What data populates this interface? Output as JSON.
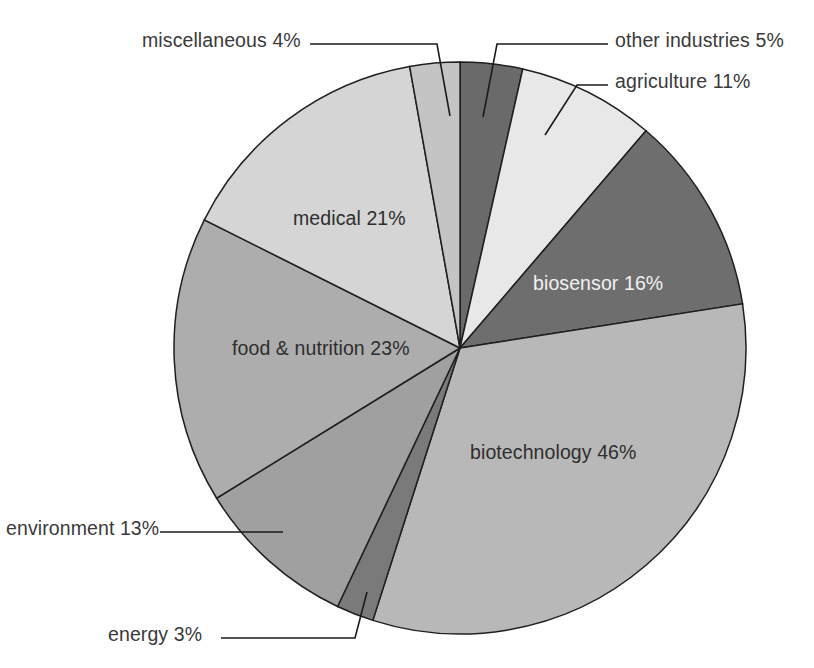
{
  "chart_data": {
    "type": "pie",
    "title": "",
    "subtitle": "",
    "xlabel": "",
    "ylabel": "",
    "legend_position": "none",
    "grid": false,
    "units": "percent",
    "note": "Slices are drawn proportionally; category shares sum to 142% because applications overlap.",
    "categories": [
      "other industries",
      "agriculture",
      "biosensor",
      "biotechnology",
      "energy",
      "environment",
      "food & nutrition",
      "medical",
      "miscellaneous"
    ],
    "values": [
      5,
      11,
      16,
      46,
      3,
      13,
      23,
      21,
      4
    ],
    "labels": [
      "other industries 5%",
      "agriculture 11%",
      "biosensor 16%",
      "biotechnology 46%",
      "energy 3%",
      "environment 13%",
      "food & nutrition 23%",
      "medical 21%",
      "miscellaneous 4%"
    ],
    "colors": [
      "#6a6a6a",
      "#e8e8e8",
      "#6e6e6e",
      "#b8b8b8",
      "#7a7a7a",
      "#a0a0a0",
      "#adadad",
      "#d5d5d5",
      "#c4c4c4"
    ],
    "slices": [
      {
        "name": "other industries",
        "value": 5,
        "label": "other industries 5%",
        "color": "#6a6a6a",
        "label_placement": "outside"
      },
      {
        "name": "agriculture",
        "value": 11,
        "label": "agriculture 11%",
        "color": "#e8e8e8",
        "label_placement": "outside"
      },
      {
        "name": "biosensor",
        "value": 16,
        "label": "biosensor 16%",
        "color": "#6e6e6e",
        "label_placement": "inside"
      },
      {
        "name": "biotechnology",
        "value": 46,
        "label": "biotechnology 46%",
        "color": "#b8b8b8",
        "label_placement": "inside"
      },
      {
        "name": "energy",
        "value": 3,
        "label": "energy 3%",
        "color": "#7a7a7a",
        "label_placement": "outside"
      },
      {
        "name": "environment",
        "value": 13,
        "label": "environment 13%",
        "color": "#a0a0a0",
        "label_placement": "outside"
      },
      {
        "name": "food & nutrition",
        "value": 23,
        "label": "food & nutrition 23%",
        "color": "#adadad",
        "label_placement": "inside"
      },
      {
        "name": "medical",
        "value": 21,
        "label": "medical 21%",
        "color": "#d5d5d5",
        "label_placement": "inside"
      },
      {
        "name": "miscellaneous",
        "value": 4,
        "label": "miscellaneous 4%",
        "color": "#c4c4c4",
        "label_placement": "outside"
      }
    ],
    "total": 142,
    "start_angle_deg": 0,
    "direction": "clockwise"
  },
  "labels": {
    "miscellaneous": "miscellaneous 4%",
    "other_industries": "other industries 5%",
    "agriculture": "agriculture 11%",
    "biosensor": "biosensor 16%",
    "biotechnology": "biotechnology 46%",
    "food_nutrition": "food & nutrition 23%",
    "medical": "medical 21%",
    "environment": "environment 13%",
    "energy": "energy 3%"
  },
  "style": {
    "background": "#ffffff",
    "outline": "#1f1f1f",
    "text_dark": "#3a3a3a",
    "text_light": "#f2f2f2"
  }
}
